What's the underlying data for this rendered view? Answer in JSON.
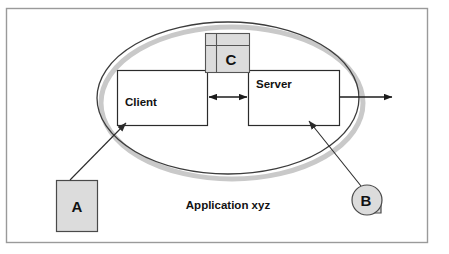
{
  "diagram": {
    "title_text": "Application xyz",
    "boundary": {
      "name": "application-boundary-ellipse",
      "shape": "ellipse",
      "cx": 228,
      "cy": 98,
      "rx": 131,
      "ry": 76,
      "fill": "#ffffff",
      "stroke": "#3c3c3c",
      "shadow_color": "#c9c9c9",
      "shadow_offset_x": 4,
      "shadow_offset_y": 5
    },
    "nodes": [
      {
        "id": "client",
        "label": "Client",
        "shape": "rectangle",
        "x": 117,
        "y": 70,
        "w": 91,
        "h": 56,
        "fill": "#ffffff",
        "stroke": "#2b2b2b",
        "label_x": 125,
        "label_y": 106
      },
      {
        "id": "server",
        "label": "Server",
        "shape": "rectangle",
        "x": 248,
        "y": 70,
        "w": 92,
        "h": 56,
        "fill": "#ffffff",
        "stroke": "#2b2b2b",
        "label_x": 256,
        "label_y": 88
      },
      {
        "id": "component-c",
        "label": "C",
        "shape": "component-box",
        "x": 205,
        "y": 33,
        "w": 45,
        "h": 40,
        "fill": "#dcdcdc",
        "stroke": "#555555",
        "divider_x": 216,
        "divider_y": 45,
        "label_x": 231,
        "label_y": 61
      },
      {
        "id": "callout-a",
        "label": "A",
        "shape": "rectangle",
        "x": 56,
        "y": 180,
        "w": 42,
        "h": 52,
        "fill": "#dcdcdc",
        "stroke": "#4a4a4a",
        "label_x": 77,
        "label_y": 212
      },
      {
        "id": "callout-b",
        "label": "B",
        "shape": "circle-with-tab",
        "cx": 367,
        "cy": 200,
        "r": 15,
        "fill": "#dcdcdc",
        "stroke": "#4a4a4a",
        "label_x": 366,
        "label_y": 206
      }
    ],
    "connectors": [
      {
        "id": "client-server-link",
        "type": "double-arrow",
        "x1": 208,
        "y1": 97,
        "x2": 248,
        "y2": 97,
        "stroke": "#1c1c1c"
      },
      {
        "id": "server-external-link",
        "type": "single-arrow",
        "x1": 340,
        "y1": 97,
        "x2": 393,
        "y2": 97,
        "stroke": "#1c1c1c"
      },
      {
        "id": "leader-a-to-client",
        "type": "leader-arrow",
        "x1": 70,
        "y1": 180,
        "x2": 127,
        "y2": 123,
        "stroke": "#2b2b2b"
      },
      {
        "id": "leader-b-to-server",
        "type": "leader-arrow",
        "x1": 361,
        "y1": 186,
        "x2": 310,
        "y2": 122,
        "stroke": "#2b2b2b"
      }
    ],
    "caption": {
      "text": "Application xyz",
      "x": 228,
      "y": 209
    },
    "frame": {
      "x": 6,
      "y": 8,
      "w": 422,
      "h": 235,
      "stroke": "#9a9a9a",
      "fill": "#ffffff"
    }
  }
}
